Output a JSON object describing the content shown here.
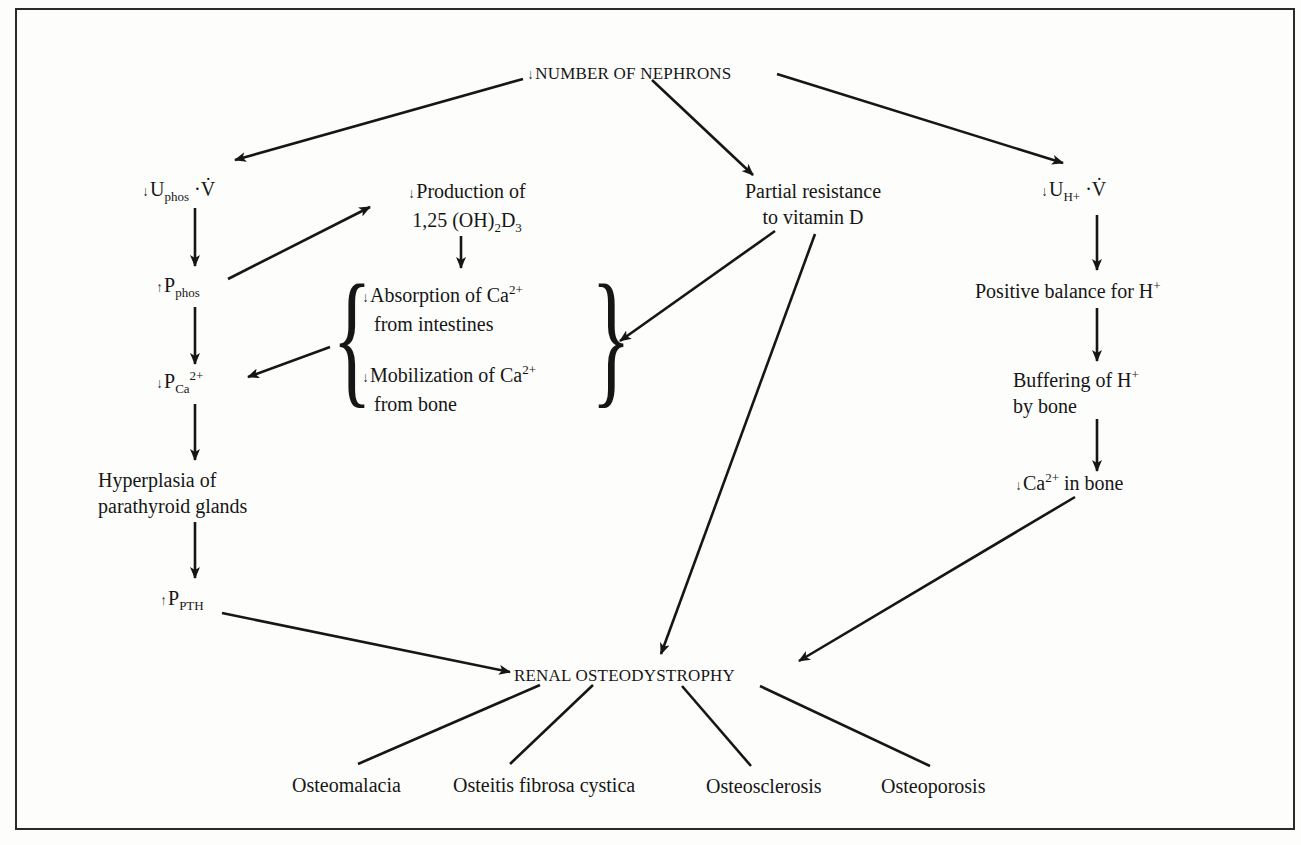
{
  "diagram": {
    "root": {
      "arrow": "down",
      "text": "NUMBER OF NEPHRONS"
    },
    "left_chain": {
      "uphos": {
        "arrow": "down",
        "main": "U",
        "sub": "phos",
        "suffix": "·V̇"
      },
      "pphos": {
        "arrow": "up",
        "main": "P",
        "sub": "phos"
      },
      "pca": {
        "arrow": "down",
        "main": "P",
        "sub": "Ca",
        "sup": "2+"
      },
      "hyperplasia": {
        "line1": "Hyperplasia of",
        "line2": "parathyroid glands"
      },
      "ppth": {
        "arrow": "up",
        "main": "P",
        "sub": "PTH"
      }
    },
    "vitd_chain": {
      "production": {
        "arrow": "down",
        "line1": "Production of",
        "line2_pre": "1,25 (OH)",
        "line2_sub1": "2",
        "line2_mid": "D",
        "line2_sub2": "3"
      },
      "absorption": {
        "arrow": "down",
        "line1_pre": "Absorption of Ca",
        "line1_sup": "2+",
        "line2": "from intestines"
      },
      "mobilization": {
        "arrow": "down",
        "line1_pre": "Mobilization of Ca",
        "line1_sup": "2+",
        "line2": "from bone"
      }
    },
    "resistance": {
      "line1": "Partial resistance",
      "line2": "to vitamin D"
    },
    "right_chain": {
      "uh": {
        "arrow": "down",
        "main": "U",
        "sub": "H+",
        "suffix": "·V̇"
      },
      "positive_balance": {
        "pre": "Positive balance for H",
        "sup": "+"
      },
      "buffering": {
        "line1_pre": "Buffering of H",
        "line1_sup": "+",
        "line2": "by bone"
      },
      "ca_bone": {
        "arrow": "down",
        "pre": "Ca",
        "sup": "2+",
        "post": " in bone"
      }
    },
    "outcome": {
      "text": "RENAL OSTEODYSTROPHY"
    },
    "subtypes": [
      "Osteomalacia",
      "Osteitis fibrosa cystica",
      "Osteosclerosis",
      "Osteoporosis"
    ],
    "glyphs": {
      "down_arrow": "↓",
      "up_arrow": "↑",
      "left_brace": "{",
      "right_brace": "}"
    },
    "colors": {
      "ink": "#161616",
      "paper": "#fdfdfb",
      "frame": "#2a2a2a"
    }
  }
}
